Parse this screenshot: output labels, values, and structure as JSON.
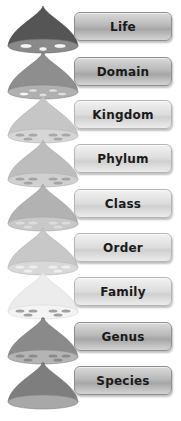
{
  "diagram": {
    "type": "taxonomy-hierarchy",
    "levels": [
      {
        "label": "Life",
        "drop_color": "#555555",
        "base_color": "#8a8a8a",
        "holes": 3,
        "top": 12
      },
      {
        "label": "Domain",
        "drop_color": "#8e8e8e",
        "base_color": "#b0b0b0",
        "holes": 4,
        "top": 57
      },
      {
        "label": "Kingdom",
        "drop_color": "#c6c6c6",
        "base_color": "#d6d6d6",
        "holes": 8,
        "top": 100
      },
      {
        "label": "Phylum",
        "drop_color": "#bdbdbd",
        "base_color": "#d0d0d0",
        "holes": 8,
        "top": 144
      },
      {
        "label": "Class",
        "drop_color": "#b2b2b2",
        "base_color": "#c8c8c8",
        "holes": 8,
        "top": 189
      },
      {
        "label": "Order",
        "drop_color": "#c8c8c8",
        "base_color": "#d8d8d8",
        "holes": 8,
        "top": 233
      },
      {
        "label": "Family",
        "drop_color": "#e8e8e8",
        "base_color": "#f2f2f2",
        "holes": 8,
        "top": 277
      },
      {
        "label": "Genus",
        "drop_color": "#8a8a8a",
        "base_color": "#b4b4b4",
        "holes": 8,
        "top": 322
      },
      {
        "label": "Species",
        "drop_color": "#7e7e7e",
        "base_color": "#a8a8a8",
        "holes": 0,
        "top": 366
      }
    ]
  }
}
